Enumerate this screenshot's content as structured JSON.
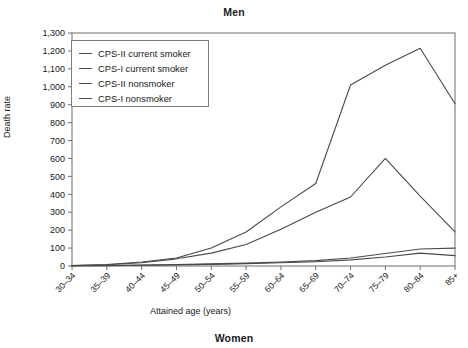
{
  "figure": {
    "title_top": "Men",
    "title_bottom": "Women"
  },
  "chart_data": {
    "type": "line",
    "title": "Men",
    "xlabel": "Attained age (years)",
    "ylabel": "Death rate",
    "categories": [
      "30–34",
      "35–39",
      "40–44",
      "45–49",
      "50–54",
      "55–59",
      "60–64",
      "65–69",
      "70–74",
      "75–79",
      "80–84",
      "85+"
    ],
    "ylim": [
      0,
      1300
    ],
    "yticks": [
      0,
      100,
      200,
      300,
      400,
      500,
      600,
      700,
      800,
      900,
      1000,
      1100,
      1200,
      1300
    ],
    "ytick_labels": [
      "0",
      "100",
      "200",
      "300",
      "400",
      "500",
      "600",
      "700",
      "800",
      "900",
      "1,000",
      "1,100",
      "1,200",
      "1,300"
    ],
    "grid": false,
    "legend_position": "top-left",
    "series": [
      {
        "name": "CPS-II current smoker",
        "color": "#4a4a4a",
        "values": [
          2,
          8,
          22,
          45,
          100,
          190,
          330,
          460,
          1010,
          1120,
          1215,
          905
        ]
      },
      {
        "name": "CPS-I current smoker",
        "color": "#4a4a4a",
        "values": [
          2,
          7,
          18,
          40,
          72,
          120,
          205,
          300,
          385,
          600,
          390,
          190
        ]
      },
      {
        "name": "CPS-II nonsmoker",
        "color": "#4a4a4a",
        "values": [
          1,
          3,
          5,
          8,
          12,
          16,
          22,
          30,
          45,
          70,
          95,
          100
        ]
      },
      {
        "name": "CPS-I nonsmoker",
        "color": "#4a4a4a",
        "values": [
          1,
          2,
          4,
          6,
          9,
          13,
          18,
          24,
          34,
          50,
          72,
          58
        ]
      }
    ]
  },
  "legend": {
    "items": [
      {
        "label": "CPS-II current smoker"
      },
      {
        "label": "CPS-I current smoker"
      },
      {
        "label": "CPS-II nonsmoker"
      },
      {
        "label": "CPS-I nonsmoker"
      }
    ]
  }
}
